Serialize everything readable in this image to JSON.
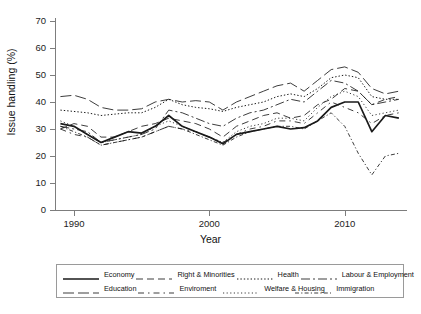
{
  "chart_data": {
    "type": "line",
    "title": "",
    "xlabel": "Year",
    "ylabel": "Issue handling (%)",
    "xlim": [
      1988.6,
      2014.6
    ],
    "ylim": [
      0,
      72
    ],
    "xticks": [
      1990,
      2000,
      2010
    ],
    "yticks": [
      0,
      10,
      20,
      30,
      40,
      50,
      60,
      70
    ],
    "grid": false,
    "legend_position": "bottom-outside",
    "x": [
      1989,
      1990,
      1991,
      1992,
      1993,
      1994,
      1995,
      1996,
      1997,
      1998,
      1999,
      2000,
      2001,
      2002,
      2003,
      2004,
      2005,
      2006,
      2007,
      2008,
      2009,
      2010,
      2011,
      2012,
      2013,
      2014
    ],
    "series": [
      {
        "name": "Economy",
        "style": "solid",
        "values": [
          32,
          31,
          28,
          25,
          27,
          29,
          28.5,
          31,
          35,
          31,
          29,
          27,
          24.5,
          28,
          29,
          30,
          31,
          30,
          30.5,
          33,
          38,
          40,
          40,
          29,
          35,
          34
        ]
      },
      {
        "name": "Right & Minorities",
        "style": "dashed",
        "values": [
          30,
          32,
          31,
          27,
          27,
          29,
          31,
          32,
          34,
          33,
          32,
          30,
          27,
          31,
          33,
          35,
          36,
          34,
          35,
          39,
          41,
          45,
          44,
          39,
          41,
          42
        ]
      },
      {
        "name": "Health",
        "style": "dotted",
        "values": [
          37,
          36.5,
          36,
          35,
          35.5,
          36,
          36,
          38,
          41,
          39,
          38,
          37.5,
          36.5,
          38,
          39,
          40,
          42,
          43,
          42,
          45,
          49,
          50,
          49,
          42,
          41,
          41
        ]
      },
      {
        "name": "Labour & Employment",
        "style": "dashdot",
        "values": [
          31,
          30,
          29,
          25,
          26,
          27,
          28,
          30,
          37,
          36,
          34,
          32,
          31,
          34,
          36,
          37,
          39,
          41,
          40,
          44,
          48,
          47,
          44,
          39,
          40,
          41
        ]
      },
      {
        "name": "Education",
        "style": "longdash",
        "values": [
          42,
          42.5,
          41,
          38,
          37,
          37,
          37.5,
          40,
          41,
          40,
          40.5,
          40,
          37,
          40,
          42,
          44,
          46,
          47,
          44,
          48,
          52,
          53,
          51,
          45,
          43,
          44
        ]
      },
      {
        "name": "Enviroment",
        "style": "dashed-wide",
        "values": [
          30,
          28,
          27,
          24,
          25,
          26,
          27,
          29,
          31,
          30,
          29,
          27,
          25,
          28,
          30,
          31,
          33,
          33,
          32,
          36,
          40,
          38,
          36,
          32,
          35,
          36
        ]
      },
      {
        "name": "Welfare & Housing",
        "style": "dotted-fine",
        "values": [
          33,
          31,
          28,
          25,
          26,
          27,
          28,
          31,
          33,
          31,
          29,
          27,
          25,
          29,
          31,
          32,
          34,
          34,
          33,
          38,
          42,
          44,
          42,
          35,
          36,
          37
        ]
      },
      {
        "name": "Immigration",
        "style": "dotted-dash",
        "values": [
          31,
          29,
          27,
          24,
          25,
          26,
          27,
          29,
          31,
          30,
          28,
          26,
          24,
          27,
          29,
          30,
          31,
          31,
          30,
          33,
          36,
          31,
          21,
          13,
          20,
          21
        ]
      }
    ]
  },
  "legend": {
    "items": [
      {
        "label": "Economy",
        "key": "solid"
      },
      {
        "label": "Right & Minorities",
        "key": "dashed"
      },
      {
        "label": "Health",
        "key": "dotted"
      },
      {
        "label": "Labour & Employment",
        "key": "dashdot"
      },
      {
        "label": "Education",
        "key": "longdash"
      },
      {
        "label": "Enviroment",
        "key": "dashed-wide"
      },
      {
        "label": "Welfare & Housing",
        "key": "dotted-fine"
      },
      {
        "label": "Immigration",
        "key": "dotted-dash"
      }
    ]
  },
  "axes": {
    "y_labels": [
      "70",
      "60",
      "50",
      "40",
      "30",
      "20",
      "10",
      "0"
    ],
    "x_labels": [
      "1990",
      "2000",
      "2010"
    ],
    "x_title": "Year",
    "y_title": "Issue handling (%)"
  },
  "colors": {
    "line": "#1a1a1a",
    "axis": "#7d7d7d",
    "background": "#ffffff"
  }
}
